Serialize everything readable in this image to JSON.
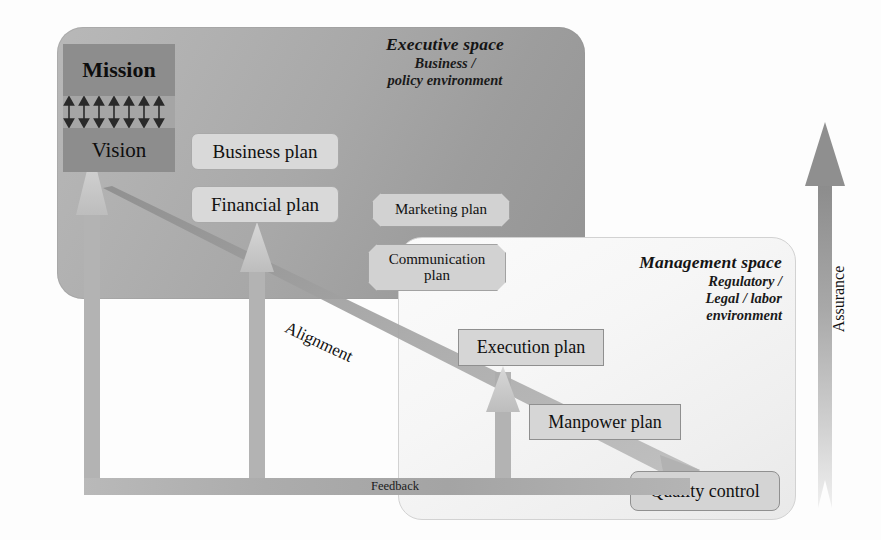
{
  "diagram": {
    "background_color": "#fdfdfd"
  },
  "executive_space": {
    "title": "Executive space",
    "subtitle_line1": "Business /",
    "subtitle_line2": "policy environment",
    "panel_color": "#a8a8a8",
    "core": {
      "mission": "Mission",
      "vision": "Vision",
      "connector_pairs": 7,
      "connector_icon": "double-arrow-up-down-icon"
    },
    "plans": [
      {
        "label": "Business plan",
        "shape": "rounded-rect"
      },
      {
        "label": "Financial plan",
        "shape": "rounded-rect"
      }
    ],
    "boundary_plans": [
      {
        "label": "Marketing plan",
        "shape": "octagon"
      },
      {
        "label": "Communication plan",
        "shape": "octagon",
        "line1": "Communication",
        "line2": "plan"
      }
    ]
  },
  "management_space": {
    "title": "Management space",
    "subtitle_line1": "Regulatory /",
    "subtitle_line2": "Legal / labor",
    "subtitle_line3": "environment",
    "panel_color": "#f4f4f4",
    "plans": [
      {
        "label": "Execution plan",
        "shape": "rect"
      },
      {
        "label": "Manpower plan",
        "shape": "rect"
      },
      {
        "label": "Quality control",
        "shape": "rounded-rect"
      }
    ]
  },
  "flows": {
    "alignment": {
      "label": "Alignment",
      "direction": "top-left-to-bottom-right",
      "icon": "tapered-arrow-icon"
    },
    "feedback": {
      "label": "Feedback",
      "direction": "right-to-left",
      "icon": "feedback-band-icon"
    },
    "assurance": {
      "label": "Assurance",
      "direction": "bottom-to-top",
      "icon": "up-arrow-icon"
    }
  },
  "colors": {
    "exec_panel": "#a8a8a8",
    "mgmt_panel": "#f4f4f4",
    "core_box": "#8d8d8d",
    "plan_box": "#d9d9d9",
    "arrow_gray": "#9a9a9a",
    "text": "#111111"
  }
}
